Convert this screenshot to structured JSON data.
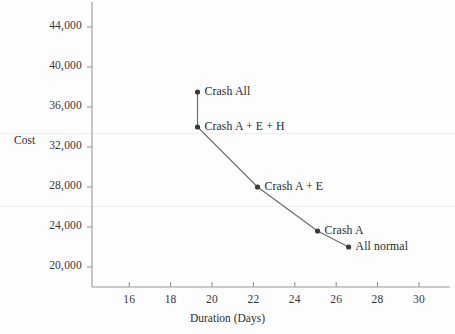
{
  "chart_data": {
    "type": "line",
    "title": "",
    "subtitle": "",
    "xlabel": "Duration (Days)",
    "ylabel": "Cost",
    "xlim": [
      14.2,
      31.5
    ],
    "ylim": [
      18000,
      46500
    ],
    "xticks": [
      16,
      18,
      20,
      22,
      24,
      26,
      28,
      30
    ],
    "xtick_labels": [
      "16",
      "18",
      "20",
      "22",
      "24",
      "26",
      "28",
      "30"
    ],
    "yticks": [
      20000,
      24000,
      28000,
      32000,
      36000,
      40000,
      44000
    ],
    "ytick_labels": [
      "20,000",
      "24,000",
      "28,000",
      "32,000",
      "36,000",
      "40,000",
      "44,000"
    ],
    "grid": false,
    "legend": "none",
    "series": [
      {
        "name": "Project cost vs duration",
        "points": [
          {
            "label": "Crash All",
            "x": 19.3,
            "y": 37500
          },
          {
            "label": "Crash A + E + H",
            "x": 19.3,
            "y": 34000
          },
          {
            "label": "Crash A + E",
            "x": 22.2,
            "y": 28000
          },
          {
            "label": "Crash A",
            "x": 25.1,
            "y": 23600
          },
          {
            "label": "All normal",
            "x": 26.6,
            "y": 22000
          }
        ]
      }
    ],
    "annotations": [
      {
        "text": "Crash All",
        "anchor_x": 19.3,
        "anchor_y": 37500
      },
      {
        "text": "Crash A + E + H",
        "anchor_x": 19.3,
        "anchor_y": 34000
      },
      {
        "text": "Crash A + E",
        "anchor_x": 22.2,
        "anchor_y": 28000
      },
      {
        "text": "Crash A",
        "anchor_x": 25.1,
        "anchor_y": 23600
      },
      {
        "text": "All normal",
        "anchor_x": 26.6,
        "anchor_y": 22000
      }
    ],
    "colors": {
      "axis": "#9a9a9a",
      "line": "#6e6e6e",
      "marker": "#3b3b3b",
      "text": "#2b2b2c",
      "background": "#fdfdfd"
    }
  }
}
